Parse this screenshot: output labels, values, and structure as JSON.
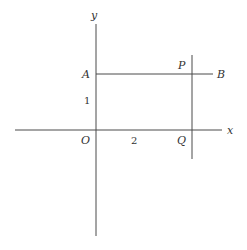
{
  "diagram": {
    "type": "coordinate-geometry",
    "axes": {
      "x_label": "x",
      "y_label": "y",
      "origin_label": "O"
    },
    "points": {
      "A": "A",
      "B": "B",
      "P": "P",
      "Q": "Q"
    },
    "tick_labels": {
      "y_unit": "1",
      "x_value": "2"
    },
    "segments": [
      {
        "name": "AB",
        "from": "A",
        "to": "B",
        "orientation": "horizontal"
      },
      {
        "name": "PQ",
        "through": [
          "P",
          "Q"
        ],
        "orientation": "vertical"
      }
    ]
  }
}
